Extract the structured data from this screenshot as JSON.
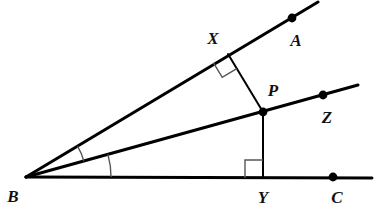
{
  "figure": {
    "type": "geometry-diagram",
    "width": 380,
    "height": 219,
    "background_color": "#ffffff",
    "stroke_color": "#000000",
    "thin_stroke_color": "#555555"
  },
  "labels": {
    "B": "B",
    "A": "A",
    "C": "C",
    "X": "X",
    "P": "P",
    "Y": "Y",
    "Z": "Z"
  },
  "chart_data": {
    "type": "scatter",
    "xlabel": "",
    "ylabel": "",
    "points": [
      {
        "name": "B",
        "x": 26,
        "y": 177,
        "label": "B",
        "label_x": 13,
        "label_y": 196,
        "marker": "none"
      },
      {
        "name": "A",
        "x": 292,
        "y": 18,
        "label": "A",
        "label_x": 296,
        "label_y": 40,
        "marker": "dot"
      },
      {
        "name": "Z",
        "x": 323,
        "y": 95,
        "label": "Z",
        "label_x": 327,
        "label_y": 117,
        "marker": "dot"
      },
      {
        "name": "C",
        "x": 333,
        "y": 177,
        "label": "C",
        "label_x": 337,
        "label_y": 197,
        "marker": "dot"
      },
      {
        "name": "X",
        "x": 228,
        "y": 54,
        "label": "X",
        "label_x": 213,
        "label_y": 38,
        "marker": "none"
      },
      {
        "name": "P",
        "x": 263,
        "y": 112,
        "label": "P",
        "label_x": 273,
        "label_y": 90,
        "marker": "dot"
      },
      {
        "name": "Y",
        "x": 263,
        "y": 178,
        "label": "Y",
        "label_x": 263,
        "label_y": 197,
        "marker": "none"
      }
    ],
    "segments": [
      {
        "name": "ray-BA",
        "from": [
          26,
          177
        ],
        "to": [
          318,
          2
        ],
        "width": 3
      },
      {
        "name": "ray-BZ",
        "from": [
          26,
          177
        ],
        "to": [
          358,
          85
        ],
        "width": 3
      },
      {
        "name": "ray-BC",
        "from": [
          26,
          177
        ],
        "to": [
          372,
          178
        ],
        "width": 3
      },
      {
        "name": "segment-XP",
        "from": [
          228,
          54
        ],
        "to": [
          263,
          112
        ],
        "width": 2
      },
      {
        "name": "segment-PY",
        "from": [
          263,
          112
        ],
        "to": [
          263,
          178
        ],
        "width": 2
      }
    ],
    "right_angles": [
      {
        "name": "right-angle-at-X",
        "vertex": [
          228,
          54
        ],
        "size": 17
      },
      {
        "name": "right-angle-at-Y",
        "vertex": [
          263,
          178
        ],
        "size": 18
      }
    ],
    "angle_arcs": [
      {
        "name": "angle-ABZ-arc",
        "vertex": [
          26,
          177
        ],
        "radius": 60
      },
      {
        "name": "angle-ZBC-arc",
        "vertex": [
          26,
          177
        ],
        "radius": 85
      }
    ]
  }
}
